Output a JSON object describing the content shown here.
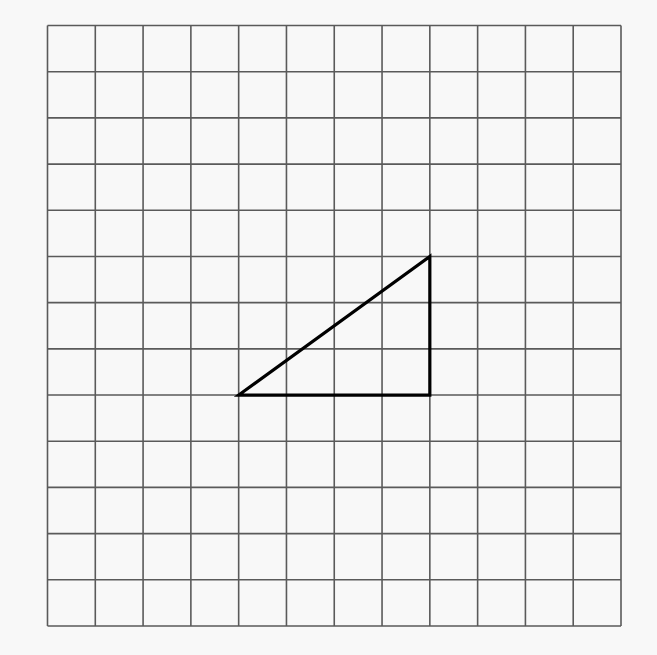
{
  "diagram": {
    "type": "grid-with-shape",
    "background": "#f8f8f8",
    "grid": {
      "columns": 12,
      "rows": 13,
      "left": 47.5,
      "top": 25.5,
      "right": 621,
      "bottom": 626,
      "line_color": "#5a5a5a",
      "line_width": 1.6
    },
    "shape": {
      "kind": "right-triangle",
      "stroke": "#000000",
      "stroke_width": 3.2,
      "fill": "none",
      "vertices_grid": [
        [
          4,
          8
        ],
        [
          8,
          8
        ],
        [
          8,
          5
        ]
      ],
      "legs": {
        "horizontal_units": 4,
        "vertical_units": 3
      }
    }
  }
}
